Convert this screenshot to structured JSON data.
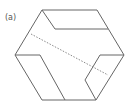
{
  "figure": {
    "label": "(a)",
    "stroke_color": "#666666",
    "dash_color": "#8a8a8a",
    "hexagon": {
      "vertices": [
        [
          42,
          10
        ],
        [
          97,
          10
        ],
        [
          124,
          55
        ],
        [
          96,
          100
        ],
        [
          42,
          100
        ],
        [
          15,
          55
        ]
      ]
    },
    "inner_lines": [
      {
        "name": "top-inner-diagonal",
        "points": [
          [
            42,
            10
          ],
          [
            55,
            29
          ]
        ]
      },
      {
        "name": "top-inner-horizontal",
        "points": [
          [
            55,
            29
          ],
          [
            108,
            29
          ]
        ]
      },
      {
        "name": "left-inner-horizontal",
        "points": [
          [
            15,
            55
          ],
          [
            40,
            55
          ]
        ]
      },
      {
        "name": "left-inner-diagonal",
        "points": [
          [
            40,
            55
          ],
          [
            65,
            100
          ]
        ]
      },
      {
        "name": "right-inner-top",
        "points": [
          [
            100,
            55
          ],
          [
            124,
            55
          ]
        ]
      },
      {
        "name": "right-inner-left-upper",
        "points": [
          [
            100,
            55
          ],
          [
            85,
            80
          ]
        ]
      },
      {
        "name": "right-inner-left-lower",
        "points": [
          [
            85,
            80
          ],
          [
            96,
            100
          ]
        ]
      }
    ],
    "dashed_line": {
      "points": [
        [
          31,
          34
        ],
        [
          108,
          75
        ]
      ]
    }
  }
}
